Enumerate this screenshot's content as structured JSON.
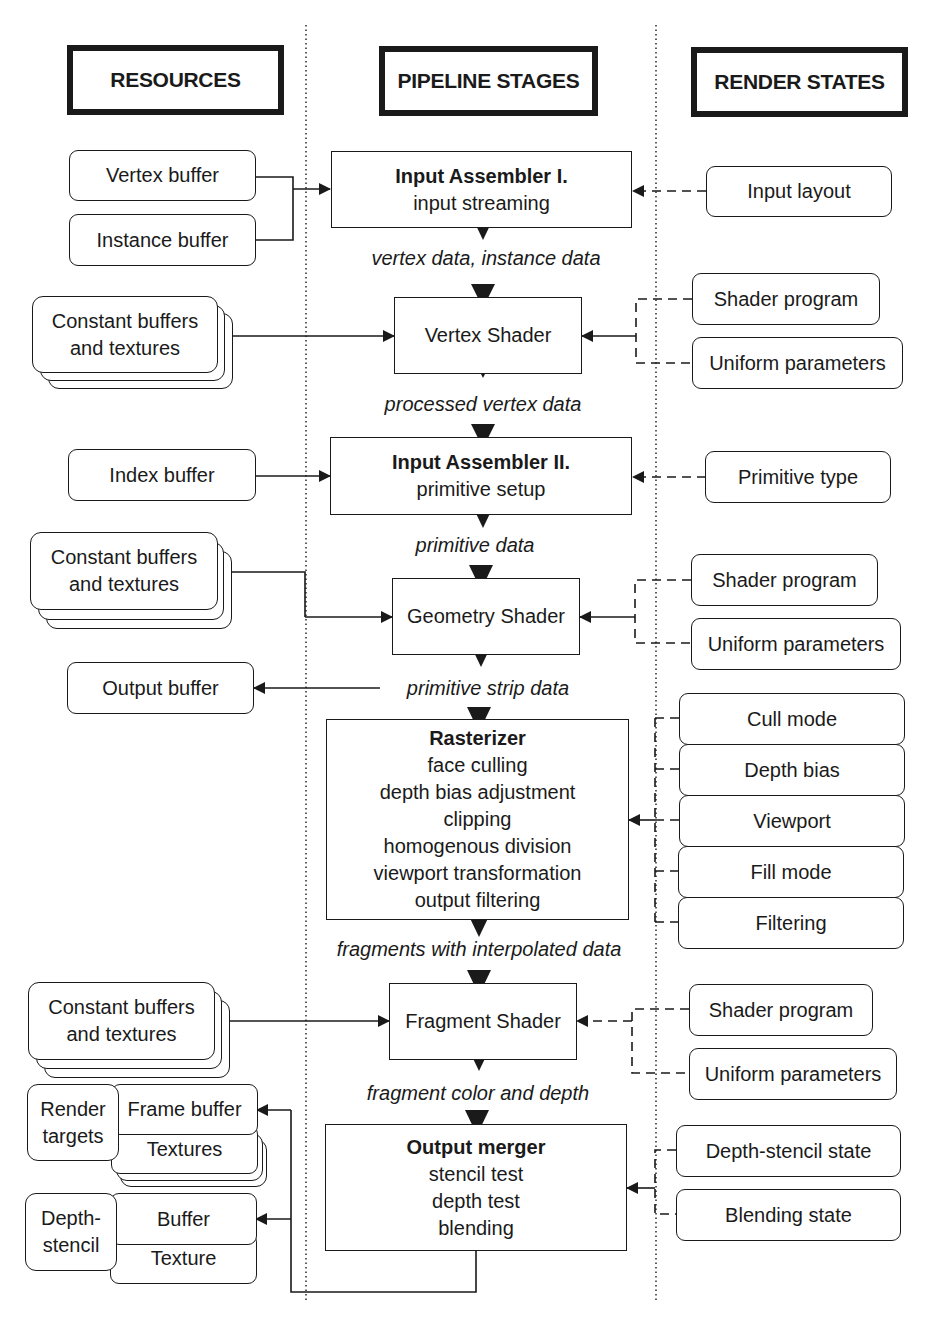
{
  "header_cutoff_text": "",
  "columns": {
    "resources": "RESOURCES",
    "pipeline": "PIPELINE STAGES",
    "states": "RENDER STATES"
  },
  "stages": [
    {
      "title": "Input Assembler I.",
      "lines": [
        "input streaming"
      ]
    },
    {
      "title": "",
      "lines": [
        "Vertex Shader"
      ]
    },
    {
      "title": "Input Assembler II.",
      "lines": [
        "primitive setup"
      ]
    },
    {
      "title": "",
      "lines": [
        "Geometry Shader"
      ]
    },
    {
      "title": "Rasterizer",
      "lines": [
        "face culling",
        "depth bias adjustment",
        "clipping",
        "homogenous division",
        "viewport transformation",
        "output filtering"
      ]
    },
    {
      "title": "",
      "lines": [
        "Fragment Shader"
      ]
    },
    {
      "title": "Output merger",
      "lines": [
        "stencil test",
        "depth test",
        "blending"
      ]
    }
  ],
  "flows": [
    "vertex data, instance data",
    "processed vertex data",
    "primitive data",
    "primitive strip data",
    "fragments with interpolated data",
    "fragment color and depth"
  ],
  "resources": {
    "vertex_buffer": "Vertex buffer",
    "instance_buffer": "Instance buffer",
    "const_vs": [
      "Constant buffers",
      "and textures"
    ],
    "index_buffer": "Index buffer",
    "const_gs": [
      "Constant buffers",
      "and textures"
    ],
    "output_buffer": "Output buffer",
    "const_fs": [
      "Constant buffers",
      "and textures"
    ],
    "render_targets": [
      "Render",
      "targets"
    ],
    "frame_buffer": "Frame buffer",
    "textures": "Textures",
    "depth_stencil": [
      "Depth-",
      "stencil"
    ],
    "ds_buffer": "Buffer",
    "ds_texture": "Texture"
  },
  "states": {
    "input_layout": "Input layout",
    "vs_shader_program": "Shader program",
    "vs_uniform_parameters": "Uniform parameters",
    "primitive_type": "Primitive type",
    "gs_shader_program": "Shader program",
    "gs_uniform_parameters": "Uniform parameters",
    "cull_mode": "Cull mode",
    "depth_bias": "Depth bias",
    "viewport": "Viewport",
    "fill_mode": "Fill mode",
    "filtering": "Filtering",
    "fs_shader_program": "Shader program",
    "fs_uniform_parameters": "Uniform parameters",
    "depth_stencil_state": "Depth-stencil state",
    "blending_state": "Blending state"
  },
  "colors": {
    "ink": "#1a1a1a",
    "background": "#ffffff"
  }
}
